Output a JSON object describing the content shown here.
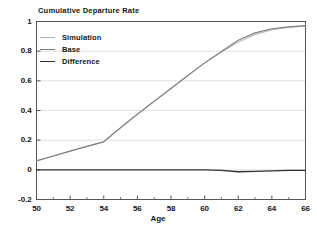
{
  "chart_data": {
    "type": "line",
    "title": "Cumulative Departure Rate",
    "xlabel": "Age",
    "ylabel": "",
    "xlim": [
      50,
      66
    ],
    "ylim": [
      -0.2,
      1.0
    ],
    "xticks": [
      50,
      52,
      54,
      56,
      58,
      60,
      62,
      64,
      66
    ],
    "xtick_labels": [
      "50",
      "52",
      "54",
      "56",
      "58",
      "60",
      "62",
      "64",
      "66"
    ],
    "xminor_ticks": [
      51,
      53,
      55,
      57,
      59,
      61,
      63,
      65
    ],
    "yticks": [
      -0.2,
      0,
      0.2,
      0.4,
      0.6,
      0.8,
      1
    ],
    "ytick_labels": [
      "-0.2",
      "0",
      "0.2",
      "0.4",
      "0.6",
      "0.8",
      "1"
    ],
    "grid": true,
    "grid_axis": "y",
    "legend_position": "upper-left-inside",
    "x": [
      50,
      51,
      52,
      53,
      54,
      55,
      56,
      57,
      58,
      59,
      60,
      61,
      62,
      63,
      64,
      65,
      66
    ],
    "series": [
      {
        "name": "Simulation",
        "color": "#b0b0b0",
        "width": 1.0,
        "values": [
          0.06,
          0.093,
          0.126,
          0.158,
          0.189,
          0.284,
          0.375,
          0.462,
          0.549,
          0.636,
          0.721,
          0.794,
          0.861,
          0.912,
          0.944,
          0.96,
          0.969
        ]
      },
      {
        "name": "Base",
        "color": "#808080",
        "width": 1.2,
        "values": [
          0.06,
          0.093,
          0.126,
          0.158,
          0.189,
          0.284,
          0.375,
          0.462,
          0.549,
          0.636,
          0.721,
          0.797,
          0.874,
          0.923,
          0.951,
          0.964,
          0.972
        ]
      },
      {
        "name": "Difference",
        "color": "#303030",
        "width": 1.3,
        "values": [
          0.0,
          0.0,
          0.0,
          0.0,
          0.0,
          0.0,
          0.0,
          0.0,
          0.0,
          0.0,
          0.0,
          -0.003,
          -0.013,
          -0.011,
          -0.007,
          -0.004,
          -0.003
        ]
      }
    ]
  },
  "colors": {
    "axis": "#555555",
    "grid": "#d8d8d8",
    "text": "#151515",
    "background": "#ffffff"
  },
  "legend": {
    "items": [
      {
        "label": "Simulation"
      },
      {
        "label": "Base"
      },
      {
        "label": "Difference"
      }
    ]
  }
}
